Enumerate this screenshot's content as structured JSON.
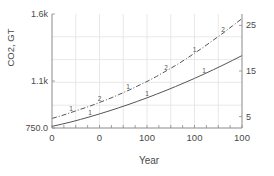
{
  "chart_data": {
    "type": "line",
    "title": "",
    "xlabel": "Year",
    "ylabel": "CO2, GT",
    "ylabel_right": "",
    "grid": true,
    "legend": "none",
    "xlim": [
      0,
      100
    ],
    "ylim": [
      750.0,
      1600.0
    ],
    "ylim_right": [
      2.5,
      27.5
    ],
    "xticks": [
      0,
      25,
      50,
      75,
      100
    ],
    "xticklabels": [
      "0",
      "0",
      "100",
      "100",
      "100"
    ],
    "yticks_left": [
      750.0,
      1100.0,
      1600.0
    ],
    "yticklabels_left": [
      "750.0",
      "1.1k",
      "1.6k"
    ],
    "yticks_right": [
      5,
      15,
      25
    ],
    "yticklabels_right": [
      "5",
      "15",
      "25"
    ],
    "series": [
      {
        "name": "series-2",
        "axis": "right",
        "style": "dash-dot",
        "marker_labels": [
          "1",
          "2",
          "1",
          "2",
          "1",
          "2"
        ],
        "color": "#555555",
        "x": [
          0,
          5,
          10,
          15,
          20,
          25,
          30,
          35,
          40,
          45,
          50,
          55,
          60,
          65,
          70,
          75,
          80,
          85,
          90,
          95,
          100
        ],
        "y": [
          4.6,
          5.2,
          5.9,
          6.6,
          7.3,
          8.1,
          8.9,
          9.8,
          10.7,
          11.7,
          12.7,
          13.8,
          15.0,
          16.2,
          17.5,
          18.9,
          20.3,
          21.8,
          23.3,
          24.9,
          26.5
        ]
      },
      {
        "name": "series-1",
        "axis": "left",
        "style": "solid",
        "marker_labels": [
          "1",
          "1",
          "1"
        ],
        "color": "#555555",
        "x": [
          0,
          5,
          10,
          15,
          20,
          25,
          30,
          35,
          40,
          45,
          50,
          55,
          60,
          65,
          70,
          75,
          80,
          85,
          90,
          95,
          100
        ],
        "y": [
          762,
          778,
          795,
          814,
          834,
          855,
          877,
          900,
          924,
          949,
          975,
          1002,
          1030,
          1059,
          1089,
          1120,
          1152,
          1185,
          1219,
          1254,
          1290
        ]
      }
    ],
    "colors": {
      "axis": "#8a8a8a",
      "grid": "#e2e2e2",
      "text": "#4a4a4a",
      "line": "#555555",
      "background": "#ffffff"
    }
  }
}
